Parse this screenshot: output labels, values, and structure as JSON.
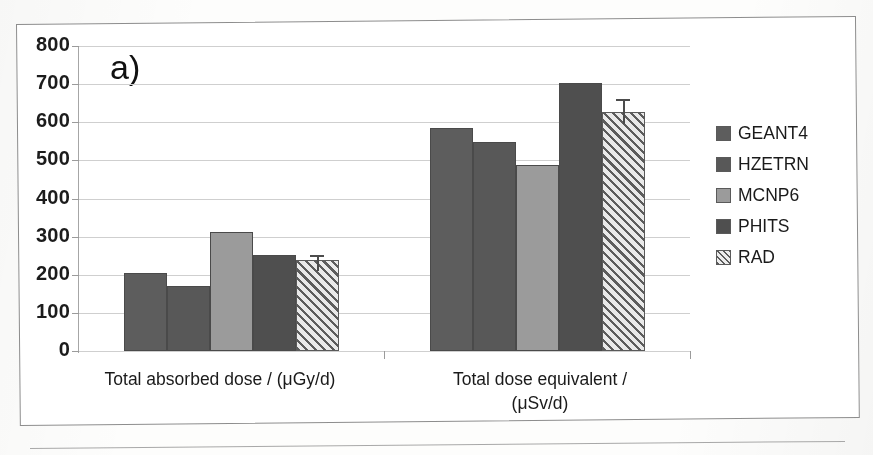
{
  "figure": {
    "panel_label": "a)",
    "background_color": "#ffffff",
    "frame_color": "#8d8d8d"
  },
  "chart_data": {
    "type": "bar",
    "title": "",
    "subtitle": "",
    "panel": "a)",
    "xlabel": "",
    "ylabel": "",
    "categories": [
      "Total absorbed dose / (μGy/d)",
      "Total dose equivalent / (μSv/d)"
    ],
    "series": [
      {
        "name": "GEANT4",
        "values": [
          205,
          585
        ],
        "errors": [
          0,
          0
        ],
        "color": "#5d5d5d",
        "pattern": "solid"
      },
      {
        "name": "HZETRN",
        "values": [
          170,
          549
        ],
        "errors": [
          0,
          0
        ],
        "color": "#585858",
        "pattern": "solid"
      },
      {
        "name": "MCNP6",
        "values": [
          312,
          488
        ],
        "errors": [
          0,
          0
        ],
        "color": "#9b9b9b",
        "pattern": "solid"
      },
      {
        "name": "PHITS",
        "values": [
          252,
          702
        ],
        "errors": [
          0,
          0
        ],
        "color": "#4f4f4f",
        "pattern": "solid"
      },
      {
        "name": "RAD",
        "values": [
          240,
          627
        ],
        "errors": [
          12,
          33
        ],
        "color": "#d6d6d6",
        "pattern": "diagonal-hatch"
      }
    ],
    "ylim": [
      0,
      800
    ],
    "ytick_values": [
      0,
      100,
      200,
      300,
      400,
      500,
      600,
      700,
      800
    ],
    "ytick_labels": [
      "0",
      "100",
      "200",
      "300",
      "400",
      "500",
      "600",
      "700",
      "800"
    ],
    "grid": true,
    "grid_axis": "y",
    "legend_position": "right",
    "legend_entries": [
      "GEANT4",
      "HZETRN",
      "MCNP6",
      "PHITS",
      "RAD"
    ]
  },
  "axis": {
    "y_ticks": [
      "800",
      "700",
      "600",
      "500",
      "400",
      "300",
      "200",
      "100",
      "0"
    ],
    "x_categories": [
      {
        "line1": "Total absorbed dose / (μGy/d)",
        "line2": ""
      },
      {
        "line1": "Total dose equivalent /",
        "line2": "(μSv/d)"
      }
    ]
  },
  "legend": {
    "items": [
      {
        "label": "GEANT4"
      },
      {
        "label": "HZETRN"
      },
      {
        "label": "MCNP6"
      },
      {
        "label": "PHITS"
      },
      {
        "label": "RAD"
      }
    ]
  }
}
